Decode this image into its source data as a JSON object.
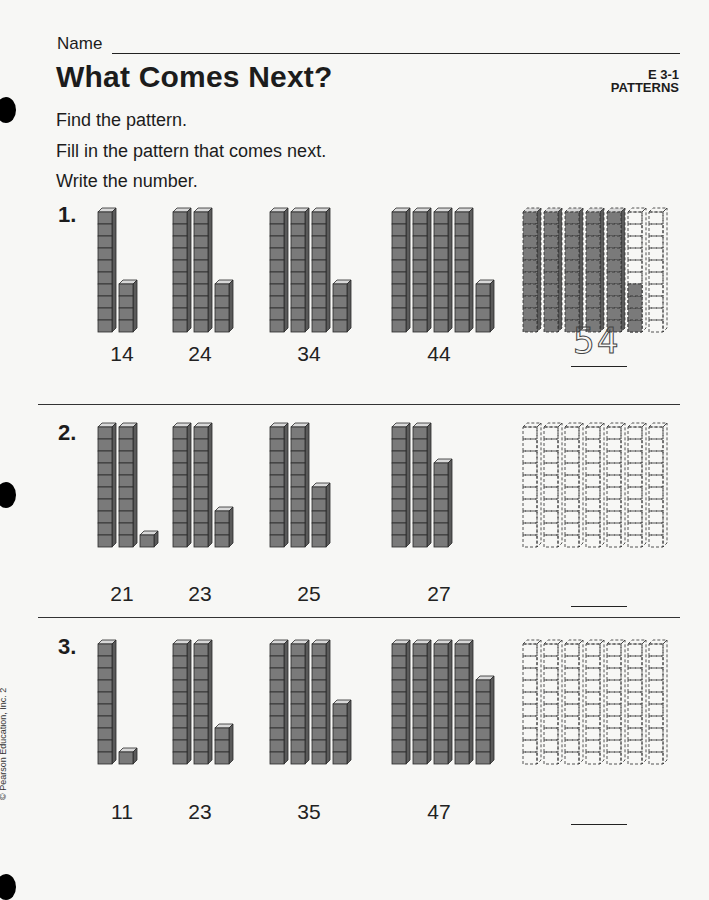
{
  "header": {
    "name_label": "Name",
    "title": "What Comes Next?",
    "code": "E 3-1",
    "category": "PATTERNS"
  },
  "instructions": [
    "Find the pattern.",
    "Fill in the pattern that comes next.",
    "Write the number."
  ],
  "problems": [
    {
      "number": "1.",
      "items": [
        {
          "tens": 1,
          "ones": 4,
          "label": "14"
        },
        {
          "tens": 2,
          "ones": 4,
          "label": "24"
        },
        {
          "tens": 3,
          "ones": 4,
          "label": "34"
        },
        {
          "tens": 4,
          "ones": 4,
          "label": "44"
        }
      ],
      "answer_model": {
        "columns": 7,
        "filled_tens": 5,
        "filled_ones": 4
      },
      "answer": "54"
    },
    {
      "number": "2.",
      "items": [
        {
          "tens": 2,
          "ones": 1,
          "label": "21"
        },
        {
          "tens": 2,
          "ones": 3,
          "label": "23"
        },
        {
          "tens": 2,
          "ones": 5,
          "label": "25"
        },
        {
          "tens": 2,
          "ones": 7,
          "label": "27"
        }
      ],
      "answer_model": {
        "columns": 7,
        "filled_tens": 0,
        "filled_ones": 0
      },
      "answer": ""
    },
    {
      "number": "3.",
      "items": [
        {
          "tens": 1,
          "ones": 1,
          "label": "11"
        },
        {
          "tens": 2,
          "ones": 3,
          "label": "23"
        },
        {
          "tens": 3,
          "ones": 5,
          "label": "35"
        },
        {
          "tens": 4,
          "ones": 7,
          "label": "47"
        }
      ],
      "answer_model": {
        "columns": 7,
        "filled_tens": 0,
        "filled_ones": 0
      },
      "answer": ""
    }
  ],
  "footer": {
    "copyright": "© Pearson Education, Inc. 2"
  },
  "colors": {
    "block_fill": "#7a7a7a",
    "block_side": "#5a5a5a",
    "block_top": "#d8d8d8",
    "outline": "#2a2a2a"
  }
}
